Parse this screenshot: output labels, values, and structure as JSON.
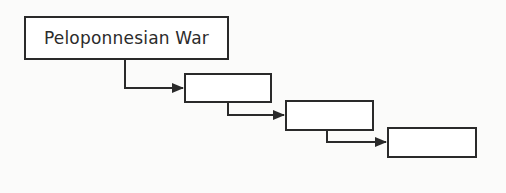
{
  "diagram": {
    "type": "cascading-flow-chart",
    "boxes": [
      {
        "id": "box-1",
        "label": "Peloponnesian War"
      },
      {
        "id": "box-2",
        "label": ""
      },
      {
        "id": "box-3",
        "label": ""
      },
      {
        "id": "box-4",
        "label": ""
      }
    ],
    "connections": [
      {
        "from": "box-1",
        "to": "box-2"
      },
      {
        "from": "box-2",
        "to": "box-3"
      },
      {
        "from": "box-3",
        "to": "box-4"
      }
    ],
    "colors": {
      "line": "#2a2a2a",
      "background": "#fbfbfa",
      "box_fill": "#ffffff"
    }
  }
}
